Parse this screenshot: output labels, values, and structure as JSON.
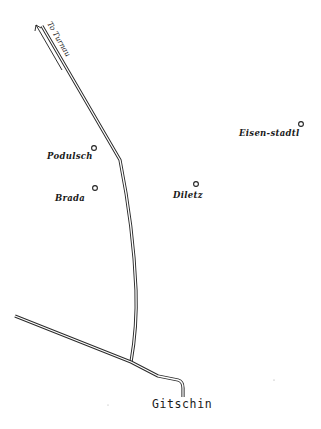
{
  "map": {
    "colors": {
      "background": "#ffffff",
      "ink": "#1a1a1a"
    },
    "road_direction_label": "To Turnau",
    "towns": [
      {
        "id": "podulsch",
        "name": "Podulsch",
        "x": 94,
        "y": 148
      },
      {
        "id": "brada",
        "name": "Brada",
        "x": 95,
        "y": 188
      },
      {
        "id": "diletz",
        "name": "Diletz",
        "x": 196,
        "y": 184
      },
      {
        "id": "eisen-stadtl",
        "name": "Eisen-stadtl",
        "x": 301,
        "y": 124
      }
    ],
    "main_town": {
      "id": "gitschin",
      "name": "Gitschin"
    }
  }
}
